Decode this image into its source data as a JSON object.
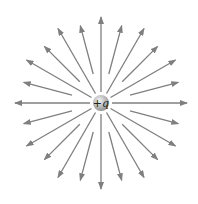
{
  "diagram": {
    "charge": {
      "label": "+q",
      "center": [
        101,
        103
      ],
      "radius": 8,
      "fill_light": "#e8e8e8",
      "fill_dark": "#8c8c8c"
    },
    "field_lines": {
      "count": 24,
      "angle_step_deg": 15,
      "start_radius": 11,
      "long_end_radius": 86,
      "short_end_radius": 80,
      "inner_gap_radius_short": 30,
      "color": "#7f7f7f",
      "direction": "outward"
    }
  }
}
